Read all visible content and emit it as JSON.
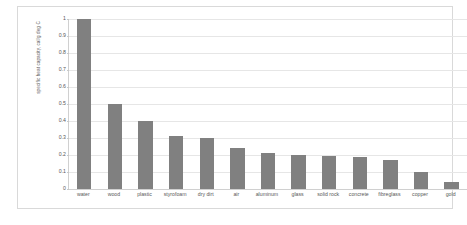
{
  "figure": {
    "caption": ""
  },
  "colors": {
    "bar": "#808080",
    "gridline": "#e6e6e6",
    "axis": "#d0d0d0",
    "frame": "#d9d9d9",
    "text": "#595959",
    "background": "#ffffff"
  },
  "chart_data": {
    "type": "bar",
    "title": "",
    "subtitle": "",
    "xlabel": "",
    "ylabel": "specific heat capacity, cal/g deg C",
    "ylim": [
      0,
      1
    ],
    "ytick_labels": [
      "1",
      "0.9",
      "0.8",
      "0.7",
      "0.6",
      "0.5",
      "0.4",
      "0.3",
      "0.2",
      "0.1",
      "0"
    ],
    "ytick_values": [
      1,
      0.9,
      0.8,
      0.7,
      0.6,
      0.5,
      0.4,
      0.3,
      0.2,
      0.1,
      0
    ],
    "grid": "horizontal",
    "legend": "none",
    "orientation": "vertical",
    "categories": [
      "water",
      "wood",
      "plastic",
      "styrofoam",
      "dry dirt",
      "air",
      "aluminum",
      "glass",
      "solid rock",
      "concrete",
      "fibreglass",
      "copper",
      "gold"
    ],
    "values": [
      1.0,
      0.5,
      0.4,
      0.31,
      0.3,
      0.24,
      0.21,
      0.2,
      0.195,
      0.19,
      0.17,
      0.1,
      0.04
    ],
    "series": [
      {
        "name": "specific heat capacity",
        "values": [
          1.0,
          0.5,
          0.4,
          0.31,
          0.3,
          0.24,
          0.21,
          0.2,
          0.195,
          0.19,
          0.17,
          0.1,
          0.04
        ]
      }
    ]
  }
}
